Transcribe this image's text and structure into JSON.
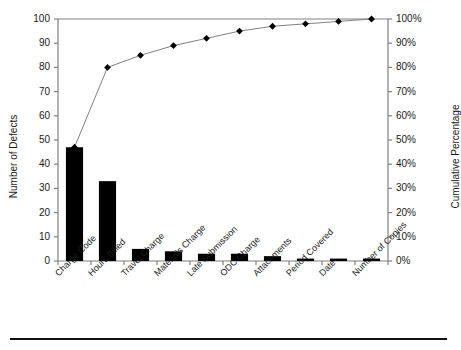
{
  "chart_data": {
    "type": "bar",
    "title": "",
    "subtitle": "",
    "xlabel": "",
    "ylabel": "Number of Defects",
    "y2label": "Cumulative Percentage",
    "categories": [
      "Charge Code",
      "Hours Billed",
      "Travel Charge",
      "Materials Charge",
      "Late Submission",
      "ODC Charge",
      "Attachments",
      "Period Covered",
      "Date",
      "Number of Copies"
    ],
    "series": [
      {
        "name": "Number of Defects",
        "kind": "bar",
        "values": [
          47,
          33,
          5,
          4,
          3,
          3,
          2,
          1,
          1,
          1
        ]
      },
      {
        "name": "Cumulative Percentage",
        "kind": "line",
        "values": [
          47,
          80,
          85,
          89,
          92,
          95,
          97,
          98,
          99,
          100
        ]
      }
    ],
    "ylim": [
      0,
      100
    ],
    "y2lim": [
      0,
      100
    ],
    "ytick_labels": [
      "0",
      "10",
      "20",
      "30",
      "40",
      "50",
      "60",
      "70",
      "80",
      "90",
      "100"
    ],
    "y2tick_labels": [
      "0%",
      "10%",
      "20%",
      "30%",
      "40%",
      "50%",
      "60%",
      "70%",
      "80%",
      "90%",
      "100%"
    ],
    "grid": false,
    "legend": "none",
    "bar_color": "#000000",
    "line_color": "#808080",
    "marker_color": "#000000",
    "axis_color": "#808080"
  }
}
